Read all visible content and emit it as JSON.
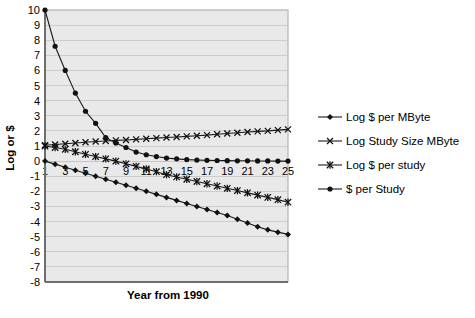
{
  "chart_data": {
    "type": "line",
    "title": "",
    "xlabel": "Year from 1990",
    "ylabel": "Log or $",
    "xlim": [
      1,
      25
    ],
    "ylim": [
      -8,
      10
    ],
    "grid": true,
    "legend_position": "right",
    "x": [
      1,
      2,
      3,
      4,
      5,
      6,
      7,
      8,
      9,
      10,
      11,
      12,
      13,
      14,
      15,
      16,
      17,
      18,
      19,
      20,
      21,
      22,
      23,
      24,
      25
    ],
    "xtick_labels": [
      "1",
      "3",
      "5",
      "7",
      "9",
      "11",
      "13",
      "15",
      "17",
      "19",
      "21",
      "23",
      "25"
    ],
    "xtick_values": [
      1,
      3,
      5,
      7,
      9,
      11,
      13,
      15,
      17,
      19,
      21,
      23,
      25
    ],
    "ytick_labels": [
      "10",
      "9",
      "8",
      "7",
      "6",
      "5",
      "4",
      "3",
      "2",
      "1",
      "0",
      "-1",
      "-2",
      "-3",
      "-4",
      "-5",
      "-6",
      "-7",
      "-8"
    ],
    "ytick_values": [
      10,
      9,
      8,
      7,
      6,
      5,
      4,
      3,
      2,
      1,
      0,
      -1,
      -2,
      -3,
      -4,
      -5,
      -6,
      -7,
      -8
    ],
    "series": [
      {
        "name": "Log $ per MByte",
        "marker": "diamond",
        "values": [
          0.0,
          -0.2,
          -0.4,
          -0.6,
          -0.8,
          -1.0,
          -1.2,
          -1.4,
          -1.6,
          -1.8,
          -2.0,
          -2.2,
          -2.4,
          -2.6,
          -2.8,
          -3.0,
          -3.2,
          -3.4,
          -3.6,
          -3.85,
          -4.1,
          -4.35,
          -4.55,
          -4.7,
          -4.85
        ]
      },
      {
        "name": "Log Study Size MByte",
        "marker": "cross-x",
        "values": [
          1.05,
          1.1,
          1.15,
          1.2,
          1.25,
          1.3,
          1.33,
          1.37,
          1.4,
          1.44,
          1.48,
          1.52,
          1.56,
          1.6,
          1.64,
          1.68,
          1.72,
          1.78,
          1.83,
          1.88,
          1.93,
          1.97,
          2.0,
          2.05,
          2.1
        ]
      },
      {
        "name": "Log $ per study",
        "marker": "asterisk",
        "values": [
          1.0,
          0.9,
          0.78,
          0.62,
          0.45,
          0.3,
          0.15,
          0.0,
          -0.18,
          -0.35,
          -0.52,
          -0.7,
          -0.9,
          -1.05,
          -1.2,
          -1.35,
          -1.5,
          -1.65,
          -1.8,
          -1.95,
          -2.1,
          -2.25,
          -2.4,
          -2.55,
          -2.72
        ]
      },
      {
        "name": "$ per Study",
        "marker": "circle",
        "values": [
          10.0,
          7.6,
          6.0,
          4.5,
          3.3,
          2.5,
          1.55,
          1.2,
          0.9,
          0.6,
          0.42,
          0.3,
          0.2,
          0.15,
          0.1,
          0.07,
          0.05,
          0.04,
          0.03,
          0.02,
          0.02,
          0.01,
          0.01,
          0.0,
          0.0
        ]
      }
    ]
  },
  "legend": {
    "items": [
      {
        "label": "Log $ per MByte",
        "marker": "diamond"
      },
      {
        "label": "Log Study Size MByte",
        "marker": "cross-x"
      },
      {
        "label": "Log $ per study",
        "marker": "asterisk"
      },
      {
        "label": "$ per Study",
        "marker": "circle"
      }
    ]
  }
}
